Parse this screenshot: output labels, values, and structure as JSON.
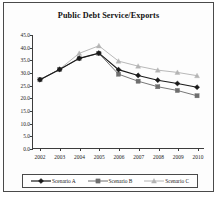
{
  "chart_data": {
    "type": "line",
    "title": "Public Debt Service/Exports",
    "xlabel": "",
    "ylabel": "",
    "categories": [
      "2002",
      "2003",
      "2004",
      "2005",
      "2006",
      "2007",
      "2008",
      "2009",
      "2010"
    ],
    "ylim": [
      0.0,
      45.0
    ],
    "ytick_labels": [
      "0.0",
      "5.0",
      "10.0",
      "15.0",
      "20.0",
      "25.0",
      "30.0",
      "35.0",
      "40.0",
      "45.0"
    ],
    "ytick_values": [
      0.0,
      5.0,
      10.0,
      15.0,
      20.0,
      25.0,
      30.0,
      35.0,
      40.0,
      45.0
    ],
    "grid": false,
    "legend_position": "bottom",
    "series": [
      {
        "name": "Scenario A",
        "color": "#1a1a1a",
        "marker": "diamond",
        "values": [
          27.2,
          31.3,
          35.7,
          37.8,
          31.2,
          28.9,
          27.0,
          25.7,
          24.2
        ]
      },
      {
        "name": "Scenario B",
        "color": "#6e6e6e",
        "marker": "square",
        "values": [
          27.2,
          31.3,
          35.6,
          37.7,
          29.4,
          26.6,
          24.4,
          22.9,
          20.8
        ]
      },
      {
        "name": "Scenario C",
        "color": "#b4b4b4",
        "marker": "triangle",
        "values": [
          27.2,
          31.4,
          37.7,
          40.7,
          34.6,
          32.6,
          31.0,
          30.1,
          28.8
        ]
      }
    ]
  },
  "legend": {
    "entries": [
      "Scenario A",
      "Scenario B",
      "Scenario C"
    ]
  }
}
